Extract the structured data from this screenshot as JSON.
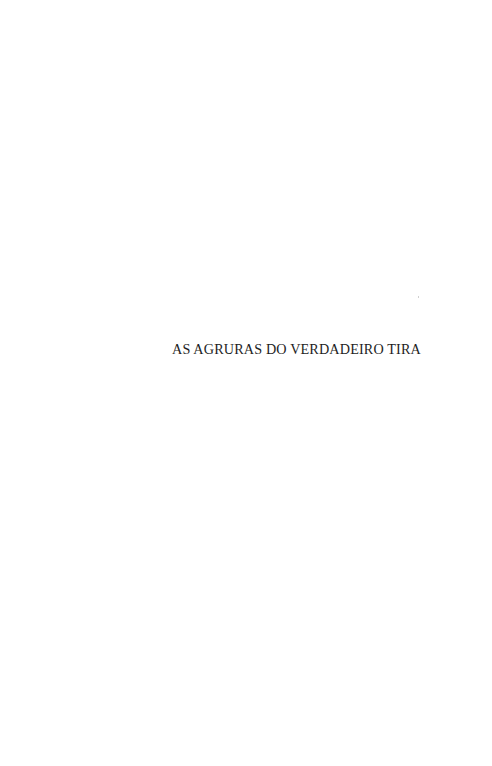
{
  "page": {
    "half_title": "AS AGRURAS DO VERDADEIRO TIRA"
  }
}
